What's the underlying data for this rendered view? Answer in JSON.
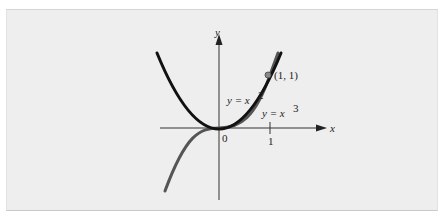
{
  "figure": {
    "axes": {
      "x_label": "x",
      "y_label": "y",
      "origin_label": "0",
      "x_tick_label": "1"
    },
    "curves": [
      {
        "name": "parabola",
        "label_prefix": "y = x",
        "exponent": "2",
        "color": "#111111"
      },
      {
        "name": "cubic",
        "label_prefix": "y = x",
        "exponent": "3",
        "color": "#555555"
      }
    ],
    "point": {
      "label": "(1, 1)",
      "color": "#777777"
    },
    "colors": {
      "panel_bg": "#eeeeee",
      "axis": "#333333"
    }
  }
}
